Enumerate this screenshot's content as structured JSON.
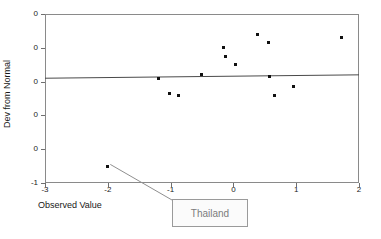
{
  "chart_data": {
    "type": "scatter",
    "title": "",
    "xlabel": "Observed Value",
    "ylabel": "Dev from Normal",
    "xlim": [
      -3,
      2
    ],
    "ylim": [
      -1.0,
      0.0
    ],
    "grid": false,
    "legend": null,
    "xticks": [
      "-3",
      "-2",
      "-1",
      "0",
      "1",
      "2"
    ],
    "xtick_values": [
      -3,
      -2,
      -1,
      0,
      1,
      2
    ],
    "yticks": [
      "0",
      "0",
      "0",
      "0",
      "0",
      "-1"
    ],
    "ytick_values": [
      0.0,
      -0.2,
      -0.4,
      -0.6,
      -0.8,
      -1.0
    ],
    "points": [
      {
        "x": -2.0,
        "y": -0.9,
        "label": "Thailand"
      },
      {
        "x": -1.19,
        "y": -0.38
      },
      {
        "x": -1.02,
        "y": -0.47
      },
      {
        "x": -0.87,
        "y": -0.48
      },
      {
        "x": -0.51,
        "y": -0.36
      },
      {
        "x": -0.16,
        "y": -0.2
      },
      {
        "x": -0.12,
        "y": -0.25
      },
      {
        "x": 0.03,
        "y": -0.3
      },
      {
        "x": 0.39,
        "y": -0.12
      },
      {
        "x": 0.56,
        "y": -0.17
      },
      {
        "x": 0.58,
        "y": -0.37
      },
      {
        "x": 0.66,
        "y": -0.48
      },
      {
        "x": 0.95,
        "y": -0.43
      },
      {
        "x": 1.72,
        "y": -0.14
      }
    ],
    "reference_line": {
      "x_start": -3,
      "y_start": -0.38,
      "x_end": 2,
      "y_end": -0.36
    },
    "annotation": {
      "text": "Thailand",
      "leader_from": {
        "x": -1.96,
        "y": -0.89
      },
      "leader_to_px": {
        "x": 172,
        "y": 200
      }
    }
  },
  "axes": {
    "x_title": "Observed Value",
    "y_title": "Dev from Normal"
  },
  "callout": {
    "label": "Thailand"
  },
  "colors": {
    "point": "#111111",
    "frame": "#8a8a8a",
    "reference_line": "#4a4a4a",
    "callout_border": "#9a9a9a",
    "callout_text": "#7b7b7b"
  }
}
